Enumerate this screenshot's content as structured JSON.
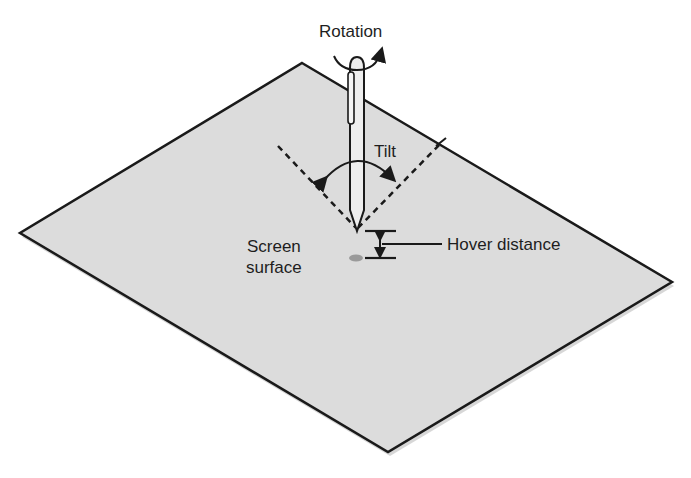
{
  "figure": {
    "labels": {
      "rotation": "Rotation",
      "tilt": "Tilt",
      "hover_distance": "Hover distance",
      "screen_surface_line1": "Screen",
      "screen_surface_line2": "surface"
    },
    "colors": {
      "background": "#ffffff",
      "surface_fill": "#dcdcdc",
      "outline": "#1a1a1a",
      "pen_fill": "#eeeeee",
      "hover_dot": "#9a9a9a",
      "text": "#1e1e1e"
    },
    "surface_corners": {
      "top": [
        302,
        63
      ],
      "right": [
        672,
        282
      ],
      "bottom": [
        388,
        452
      ],
      "left": [
        20,
        233
      ]
    },
    "pen": {
      "tip": [
        357,
        230
      ],
      "top": [
        357,
        58
      ]
    }
  }
}
